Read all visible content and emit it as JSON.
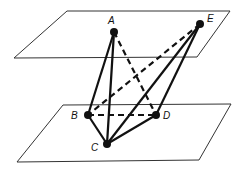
{
  "diagram": {
    "title": "",
    "planes": [
      {
        "name": "upper-plane",
        "corners": [
          [
            67,
            11
          ],
          [
            230,
            11
          ],
          [
            197,
            57
          ],
          [
            14,
            58
          ]
        ]
      },
      {
        "name": "lower-plane",
        "corners": [
          [
            63,
            105
          ],
          [
            231,
            104
          ],
          [
            199,
            160
          ],
          [
            17,
            162
          ]
        ]
      }
    ],
    "points": [
      {
        "label": "A",
        "x": 114,
        "y": 32,
        "lx": 108,
        "ly": 24
      },
      {
        "label": "E",
        "x": 200,
        "y": 24,
        "lx": 207,
        "ly": 22
      },
      {
        "label": "B",
        "x": 88,
        "y": 115,
        "lx": 71,
        "ly": 119
      },
      {
        "label": "D",
        "x": 156,
        "y": 115,
        "lx": 163,
        "ly": 119
      },
      {
        "label": "C",
        "x": 107,
        "y": 144,
        "lx": 91,
        "ly": 151
      }
    ],
    "edges": [
      {
        "from": "A",
        "to": "B",
        "style": "solid"
      },
      {
        "from": "A",
        "to": "C",
        "style": "solid"
      },
      {
        "from": "A",
        "to": "D",
        "style": "dashed"
      },
      {
        "from": "E",
        "to": "B",
        "style": "dashed"
      },
      {
        "from": "E",
        "to": "C",
        "style": "solid"
      },
      {
        "from": "E",
        "to": "D",
        "style": "solid"
      },
      {
        "from": "B",
        "to": "D",
        "style": "dashed"
      },
      {
        "from": "B",
        "to": "C",
        "style": "solid"
      },
      {
        "from": "C",
        "to": "D",
        "style": "solid"
      }
    ],
    "colors": {
      "line": "#111111",
      "plane": "#333333",
      "background": "#ffffff"
    }
  }
}
